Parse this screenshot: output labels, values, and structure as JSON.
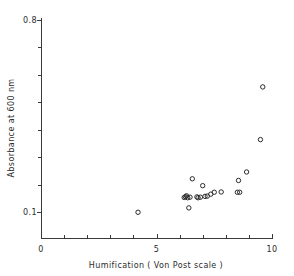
{
  "figure": {
    "title": "",
    "background_color": "#ffffff",
    "foreground_color": "#2b2b2b"
  },
  "axes": {
    "x_title": "Humification ( Von Post scale )",
    "y_title": "Absorbance at 600 nm",
    "x_tick_labels": [
      "0",
      "5",
      "10"
    ],
    "y_tick_labels": [
      "0.8",
      "0.1"
    ],
    "x_min_label": "0",
    "x_max_label": "10",
    "y_min_label": "0.1",
    "y_max_label": "0.8"
  },
  "chart_data": {
    "type": "scatter",
    "title": "",
    "xlabel": "Humification ( Von Post scale )",
    "ylabel": "Absorbance at 600 nm",
    "xlim": [
      0,
      10
    ],
    "ylim": [
      0.0336,
      0.8
    ],
    "xticks": [
      0,
      1,
      2,
      3,
      4,
      5,
      6,
      7,
      8,
      9,
      10
    ],
    "xticklabels": [
      "0",
      "",
      "",
      "",
      "",
      "5",
      "",
      "",
      "",
      "",
      "10"
    ],
    "yticks": [
      0.1,
      0.2,
      0.3,
      0.4,
      0.5,
      0.6,
      0.7,
      0.8
    ],
    "yticklabels": [
      "0.1",
      "",
      "",
      "",
      "",
      "",
      "",
      "0.8"
    ],
    "grid": false,
    "legend": null,
    "marker": "open-circle",
    "marker_size": 3,
    "series": [
      {
        "name": "samples",
        "x": [
          4.2,
          6.2,
          6.25,
          6.3,
          6.35,
          6.4,
          6.45,
          6.55,
          6.75,
          6.8,
          6.9,
          7.0,
          7.1,
          7.2,
          7.35,
          7.5,
          7.8,
          8.5,
          8.55,
          8.6,
          8.9,
          9.5,
          9.6
        ],
        "y": [
          0.099,
          0.153,
          0.156,
          0.159,
          0.152,
          0.115,
          0.154,
          0.221,
          0.155,
          0.152,
          0.154,
          0.196,
          0.157,
          0.158,
          0.165,
          0.172,
          0.173,
          0.172,
          0.215,
          0.172,
          0.246,
          0.364,
          0.556
        ],
        "points": [
          {
            "x": 4.2,
            "y": 0.099
          },
          {
            "x": 6.2,
            "y": 0.153
          },
          {
            "x": 6.25,
            "y": 0.156
          },
          {
            "x": 6.3,
            "y": 0.159
          },
          {
            "x": 6.35,
            "y": 0.152
          },
          {
            "x": 6.4,
            "y": 0.115
          },
          {
            "x": 6.45,
            "y": 0.154
          },
          {
            "x": 6.55,
            "y": 0.221
          },
          {
            "x": 6.75,
            "y": 0.155
          },
          {
            "x": 6.8,
            "y": 0.152
          },
          {
            "x": 6.9,
            "y": 0.154
          },
          {
            "x": 7.0,
            "y": 0.196
          },
          {
            "x": 7.1,
            "y": 0.157
          },
          {
            "x": 7.2,
            "y": 0.158
          },
          {
            "x": 7.35,
            "y": 0.165
          },
          {
            "x": 7.5,
            "y": 0.172
          },
          {
            "x": 7.8,
            "y": 0.173
          },
          {
            "x": 8.5,
            "y": 0.172
          },
          {
            "x": 8.55,
            "y": 0.215
          },
          {
            "x": 8.6,
            "y": 0.172
          },
          {
            "x": 8.9,
            "y": 0.246
          },
          {
            "x": 9.5,
            "y": 0.364
          },
          {
            "x": 9.6,
            "y": 0.556
          }
        ]
      }
    ]
  },
  "geometry": {
    "x_axis_y_px": 238,
    "y_axis_x_px": 41,
    "x0_px": 41,
    "x10_px": 272,
    "y_top_px": 20,
    "y_0p1_px": 212,
    "y_axis_bottom_px": 238
  }
}
